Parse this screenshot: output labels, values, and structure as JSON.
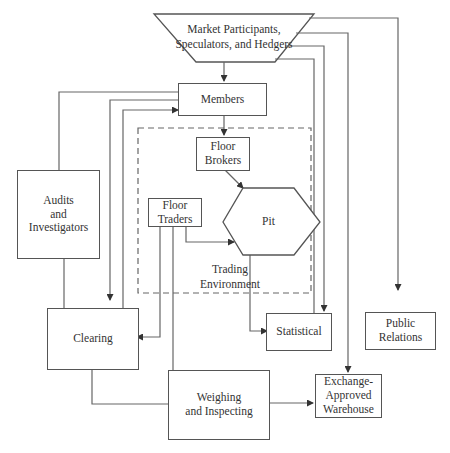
{
  "diagram": {
    "nodes": {
      "market": "Market Participants,\nSpeculators, and Hedgers",
      "members": "Members",
      "floor_brokers": "Floor\nBrokers",
      "floor_traders": "Floor\nTraders",
      "pit": "Pit",
      "trading_environment": "Trading\nEnvironment",
      "audits": "Audits\nand\nInvestigators",
      "clearing": "Clearing",
      "statistical": "Statistical",
      "public_relations": "Public\nRelations",
      "weighing": "Weighing\nand Inspecting",
      "warehouse": "Exchange-\nApproved\nWarehouse"
    },
    "edges": [
      {
        "from": "Market Participants, Speculators, and Hedgers",
        "to": "Members",
        "arrow": true
      },
      {
        "from": "Market Participants, Speculators, and Hedgers",
        "to": "Public Relations",
        "arrow": true
      },
      {
        "from": "Market Participants, Speculators, and Hedgers",
        "to": "Exchange-Approved Warehouse",
        "arrow": true
      },
      {
        "from": "Market Participants, Speculators, and Hedgers",
        "to": "Statistical",
        "arrow": true
      },
      {
        "from": "Market Participants, Speculators, and Hedgers",
        "to": "Statistical",
        "arrow": false
      },
      {
        "from": "Members",
        "to": "Floor Brokers",
        "arrow": true
      },
      {
        "from": "Floor Brokers",
        "to": "Pit",
        "arrow": true
      },
      {
        "from": "Floor Traders",
        "to": "Pit",
        "arrow": true
      },
      {
        "from": "Floor Traders",
        "to": "Clearing",
        "arrow": true
      },
      {
        "from": "Floor Traders",
        "to": "Weighing and Inspecting",
        "arrow": false
      },
      {
        "from": "Pit",
        "to": "Statistical",
        "arrow": true
      },
      {
        "from": "Members",
        "to": "Audits and Investigators",
        "arrow": false
      },
      {
        "from": "Members",
        "to": "Clearing",
        "arrow": true
      },
      {
        "from": "Clearing",
        "to": "Members",
        "arrow": true
      },
      {
        "from": "Clearing",
        "to": "Weighing and Inspecting",
        "arrow": false
      },
      {
        "from": "Weighing and Inspecting",
        "to": "Exchange-Approved Warehouse",
        "arrow": true
      },
      {
        "from": "Audits and Investigators",
        "to": "Clearing",
        "arrow": false
      }
    ],
    "colors": {
      "line": "#555555",
      "background": "#ffffff",
      "text": "#333333"
    }
  }
}
